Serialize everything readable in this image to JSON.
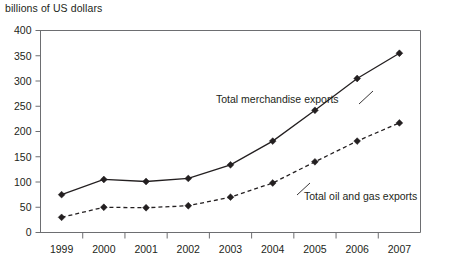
{
  "axis_title": "billions of US dollars",
  "annotations": {
    "merchandise": "Total merchandise exports",
    "oil_gas": "Total oil and gas exports"
  },
  "chart_data": {
    "type": "line",
    "title": "",
    "subtitle": "",
    "xlabel": "",
    "ylabel": "billions of US dollars",
    "ylim": [
      0,
      400
    ],
    "ytick_step": 50,
    "yticks": [
      "0",
      "50",
      "100",
      "150",
      "200",
      "250",
      "300",
      "350",
      "400"
    ],
    "grid": false,
    "legend_position": "inline-annotation",
    "categories": [
      "1999",
      "2000",
      "2001",
      "2002",
      "2003",
      "2004",
      "2005",
      "2006",
      "2007"
    ],
    "series": [
      {
        "name": "Total merchandise exports",
        "style": "solid",
        "marker": "diamond",
        "color": "#231f20",
        "values": [
          75,
          105,
          101,
          107,
          134,
          181,
          242,
          305,
          355
        ]
      },
      {
        "name": "Total oil and gas exports",
        "style": "dashed",
        "marker": "diamond",
        "color": "#231f20",
        "values": [
          30,
          50,
          49,
          53,
          70,
          98,
          140,
          181,
          217
        ]
      }
    ]
  }
}
